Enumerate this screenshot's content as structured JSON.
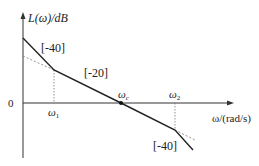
{
  "diagram": {
    "type": "bode-magnitude-asymptote",
    "y_axis_label": "L(ω)/dB",
    "x_axis_label": "ω/(rad/s)",
    "origin_label": "0",
    "frequencies": {
      "omega1": "ω1",
      "omega_c": "ωc",
      "omega2": "ω2"
    },
    "slopes": {
      "low_freq": "[-40]",
      "mid_freq": "[-20]",
      "high_freq": "[-40]"
    },
    "colors": {
      "line": "#222222",
      "dashed": "#777777",
      "background": "#ffffff"
    }
  }
}
